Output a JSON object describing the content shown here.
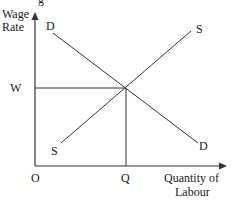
{
  "diagram": {
    "type": "supply-demand",
    "title_fragment": "g",
    "y_axis_label": [
      "Wage",
      "Rate"
    ],
    "x_axis_label": [
      "Quantity of",
      "Labour"
    ],
    "origin_label": "O",
    "equilibrium_wage_label": "W",
    "equilibrium_quantity_label": "Q",
    "demand_label_top": "D",
    "demand_label_bottom": "D",
    "supply_label_top": "S",
    "supply_label_bottom": "S",
    "line_color": "#333333"
  }
}
